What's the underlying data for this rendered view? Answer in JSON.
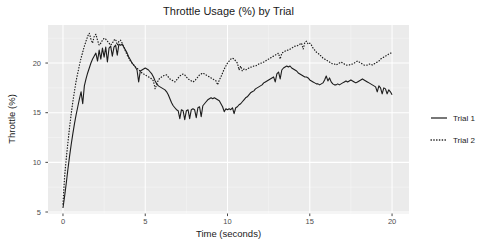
{
  "chart_data": {
    "type": "line",
    "title": "Throttle Usage (%) by Trial",
    "xlabel": "Time (seconds)",
    "ylabel": "Throttle (%)",
    "x_ticks": [
      0,
      5,
      10,
      15,
      20
    ],
    "y_ticks": [
      5,
      10,
      15,
      20
    ],
    "x_minor": [
      2.5,
      7.5,
      12.5,
      17.5
    ],
    "y_minor": [
      7.5,
      12.5,
      17.5,
      22.5
    ],
    "xlim": [
      -0.91,
      21.03
    ],
    "ylim": [
      4.85,
      23.83
    ],
    "grid": "major-and-minor-on",
    "legend_position": "right",
    "panel_bg": "#EBEBEB",
    "grid_major_color": "#FFFFFF",
    "grid_minor_color": "rgba(255,255,255,0.55)",
    "line_color": "#1C1C1C",
    "tick_color": "#333333",
    "tick_label_color": "#4d4d4d",
    "x_start": 0,
    "x_step": 0.1,
    "series": [
      {
        "name": "Trial 1",
        "linetype": "solid",
        "values": [
          5.4,
          6.6,
          7.9,
          9.3,
          10.6,
          11.8,
          12.9,
          13.9,
          14.8,
          15.6,
          16.4,
          17.1,
          15.9,
          17.7,
          18.4,
          19.0,
          19.5,
          20.0,
          20.4,
          20.7,
          21.0,
          20.2,
          21.3,
          20.4,
          21.5,
          20.6,
          21.6,
          20.1,
          21.5,
          21.7,
          20.7,
          21.6,
          21.8,
          20.8,
          21.9,
          21.8,
          21.9,
          21.6,
          21.3,
          21.0,
          20.6,
          20.3,
          20.0,
          19.8,
          19.6,
          19.3,
          18.1,
          19.2,
          19.3,
          19.4,
          19.5,
          19.4,
          19.3,
          19.1,
          18.9,
          18.6,
          18.2,
          17.9,
          17.7,
          17.6,
          17.5,
          17.4,
          17.3,
          17.1,
          16.8,
          16.4,
          16.0,
          15.7,
          15.5,
          15.3,
          15.2,
          14.4,
          15.3,
          15.2,
          14.3,
          15.2,
          15.3,
          14.4,
          15.3,
          15.4,
          15.3,
          14.5,
          15.5,
          15.6,
          14.6,
          15.7,
          15.9,
          16.1,
          16.3,
          16.4,
          16.5,
          16.4,
          16.5,
          16.4,
          16.3,
          16.2,
          15.9,
          15.6,
          15.1,
          15.4,
          15.3,
          15.4,
          15.3,
          15.5,
          14.9,
          15.5,
          15.6,
          15.8,
          15.9,
          16.1,
          16.3,
          16.5,
          16.6,
          16.8,
          17.0,
          17.1,
          17.2,
          17.4,
          17.5,
          17.6,
          17.7,
          17.8,
          18.0,
          18.1,
          18.2,
          18.3,
          18.4,
          18.5,
          18.6,
          18.1,
          18.9,
          19.1,
          18.4,
          19.3,
          19.5,
          19.6,
          19.7,
          19.6,
          19.7,
          19.5,
          19.4,
          19.3,
          19.2,
          19.0,
          18.9,
          18.8,
          18.7,
          18.6,
          18.6,
          18.5,
          18.3,
          18.2,
          18.1,
          18.0,
          17.9,
          17.9,
          17.8,
          17.9,
          18.0,
          18.3,
          18.7,
          18.2,
          18.5,
          18.1,
          17.9,
          17.8,
          17.8,
          17.9,
          17.8,
          17.9,
          18.0,
          18.1,
          18.2,
          18.1,
          18.2,
          18.3,
          18.2,
          18.1,
          18.0,
          18.1,
          18.2,
          18.3,
          18.4,
          18.3,
          18.2,
          18.1,
          18.0,
          17.9,
          17.8,
          17.7,
          17.6,
          17.1,
          17.7,
          17.5,
          16.9,
          17.5,
          17.4,
          16.9,
          17.3,
          17.1,
          16.8
        ]
      },
      {
        "name": "Trial 2",
        "linetype": "dotted",
        "values": [
          5.8,
          8.6,
          10.4,
          12.0,
          13.5,
          14.9,
          16.1,
          17.2,
          18.2,
          19.0,
          19.8,
          20.5,
          21.1,
          21.7,
          22.2,
          22.7,
          23.0,
          22.4,
          22.0,
          22.7,
          22.9,
          22.3,
          21.8,
          22.0,
          22.3,
          22.5,
          22.4,
          22.2,
          22.0,
          21.8,
          22.0,
          22.3,
          22.4,
          21.8,
          22.2,
          22.3,
          22.0,
          21.6,
          21.2,
          20.8,
          20.5,
          20.2,
          20.0,
          19.8,
          19.6,
          19.5,
          19.3,
          19.2,
          19.0,
          18.9,
          18.8,
          18.7,
          18.6,
          18.5,
          18.4,
          18.2,
          17.4,
          17.9,
          18.3,
          18.5,
          18.6,
          18.7,
          18.8,
          18.8,
          18.6,
          18.4,
          18.3,
          18.2,
          18.1,
          18.3,
          18.5,
          18.7,
          18.8,
          18.9,
          18.8,
          18.6,
          18.4,
          18.3,
          18.2,
          18.1,
          18.2,
          18.4,
          18.6,
          18.8,
          18.9,
          19.0,
          18.9,
          18.8,
          18.7,
          18.6,
          18.5,
          18.4,
          18.3,
          18.2,
          17.8,
          18.3,
          18.6,
          19.0,
          19.4,
          19.7,
          20.0,
          20.2,
          20.4,
          20.5,
          20.4,
          20.2,
          20.0,
          19.3,
          19.7,
          19.2,
          19.4,
          19.3,
          19.4,
          19.5,
          19.6,
          19.6,
          19.7,
          19.7,
          19.8,
          19.9,
          20.0,
          20.0,
          20.1,
          20.2,
          20.3,
          20.4,
          20.5,
          20.6,
          20.7,
          20.8,
          20.9,
          21.0,
          20.4,
          21.0,
          21.1,
          21.2,
          21.3,
          21.3,
          21.4,
          21.5,
          21.6,
          21.7,
          21.7,
          21.8,
          21.9,
          22.0,
          21.4,
          22.1,
          22.2,
          21.9,
          22.0,
          21.8,
          21.5,
          21.3,
          21.1,
          21.0,
          20.8,
          20.7,
          20.5,
          20.4,
          20.3,
          20.2,
          20.1,
          20.0,
          19.9,
          19.9,
          19.8,
          19.9,
          20.0,
          20.1,
          20.0,
          19.9,
          19.8,
          19.8,
          19.8,
          19.9,
          19.9,
          20.0,
          20.1,
          20.2,
          20.1,
          20.0,
          19.9,
          19.8,
          19.8,
          19.8,
          19.9,
          19.9,
          19.8,
          19.9,
          20.0,
          20.1,
          20.2,
          20.4,
          20.5,
          20.6,
          20.7,
          20.8,
          20.9,
          21.0,
          21.0
        ]
      }
    ]
  }
}
